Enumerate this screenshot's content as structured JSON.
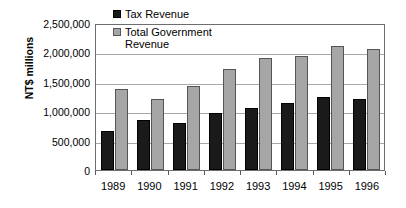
{
  "chart_data": {
    "type": "bar",
    "title": "",
    "xlabel": "",
    "ylabel": "NT$ millions",
    "ylim": [
      0,
      2500000
    ],
    "ytick_step": 500000,
    "grid": true,
    "legend_position": "top-left-inside",
    "categories": [
      "1989",
      "1990",
      "1991",
      "1992",
      "1993",
      "1994",
      "1995",
      "1996"
    ],
    "ytick_labels": [
      "2,500,000",
      "2,000,000",
      "1,500,000",
      "1,000,000",
      "500,000",
      "0"
    ],
    "ytick_values": [
      2500000,
      2000000,
      1500000,
      1000000,
      500000,
      0
    ],
    "series": [
      {
        "name": "Tax Revenue",
        "color": "#1a1a1a",
        "values": [
          660000,
          845000,
          800000,
          975000,
          1050000,
          1140000,
          1250000,
          1215000
        ]
      },
      {
        "name": "Total Government Revenue",
        "color": "#a6a6a6",
        "values": [
          1385000,
          1205000,
          1430000,
          1715000,
          1900000,
          1935000,
          2115000,
          2060000
        ]
      }
    ]
  },
  "legend": {
    "items": [
      {
        "label": "Tax Revenue",
        "color": "#1a1a1a"
      },
      {
        "label": "Total Government\nRevenue",
        "color": "#a6a6a6"
      }
    ]
  },
  "colors": {
    "tax_revenue": "#1a1a1a",
    "total_government_revenue": "#a6a6a6",
    "gridline": "#a8a8a8",
    "axis": "#6e6e6e",
    "background": "#ffffff"
  }
}
